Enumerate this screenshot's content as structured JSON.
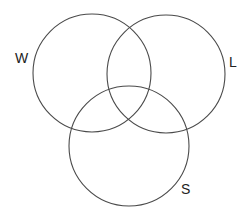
{
  "diagram": {
    "type": "venn",
    "stroke_color": "#4a4a4a",
    "sets": [
      {
        "id": "W",
        "label": "W",
        "cx": 92,
        "cy": 73,
        "r": 59,
        "label_x": 15,
        "label_y": 63
      },
      {
        "id": "L",
        "label": "L",
        "cx": 166,
        "cy": 74,
        "r": 59,
        "label_x": 229,
        "label_y": 67
      },
      {
        "id": "S",
        "label": "S",
        "cx": 129,
        "cy": 146,
        "r": 60,
        "label_x": 181,
        "label_y": 194
      }
    ]
  }
}
